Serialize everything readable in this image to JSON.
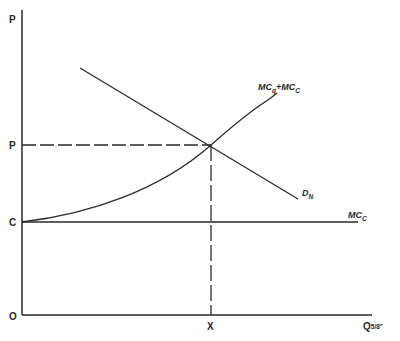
{
  "diagram": {
    "type": "supply-demand",
    "axes": {
      "y_label": "P",
      "x_label_main": "Q",
      "x_label_sub": "5/8\"",
      "origin_label": "O"
    },
    "y_ticks": [
      {
        "label": "P",
        "role": "equilibrium price"
      },
      {
        "label": "C",
        "role": "constant marginal cost"
      }
    ],
    "x_ticks": [
      {
        "label": "X",
        "role": "equilibrium quantity"
      }
    ],
    "curves": {
      "demand": {
        "label": "D",
        "subscript": "N"
      },
      "total_mc": {
        "label_part1": "MC",
        "sub1": "q",
        "plus": "+",
        "label_part2": "MC",
        "sub2": "C"
      },
      "constant_mc": {
        "label": "MC",
        "subscript": "C"
      }
    },
    "colors": {
      "line": "#2a2a2a",
      "background": "#ffffff"
    }
  }
}
